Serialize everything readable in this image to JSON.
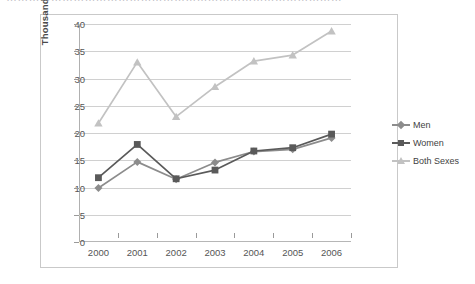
{
  "top_strip": {
    "ghost_text": "………………………………………………………………………………"
  },
  "chart_data": {
    "type": "line",
    "title": "",
    "subtitle": "",
    "xlabel": "",
    "ylabel": "Thousands",
    "categories": [
      "2000",
      "2001",
      "2002",
      "2003",
      "2004",
      "2005",
      "2006"
    ],
    "x": [
      2000,
      2001,
      2002,
      2003,
      2004,
      2005,
      2006
    ],
    "ylim": [
      0,
      40
    ],
    "ytick_values": [
      0,
      5,
      10,
      15,
      20,
      25,
      30,
      35,
      40
    ],
    "ytick_labels": [
      "0",
      "5",
      "10",
      "15",
      "20",
      "25",
      "30",
      "35",
      "40"
    ],
    "grid": "horizontal",
    "legend_position": "right",
    "series": [
      {
        "name": "Men",
        "color": "#8c8c8c",
        "marker": "diamond",
        "values": [
          9.9,
          14.7,
          11.5,
          14.6,
          16.6,
          17.0,
          19.1
        ]
      },
      {
        "name": "Women",
        "color": "#5a5a5a",
        "marker": "square",
        "values": [
          11.8,
          17.9,
          11.6,
          13.2,
          16.7,
          17.3,
          19.8
        ]
      },
      {
        "name": "Both Sexes",
        "color": "#c2c2c2",
        "marker": "triangle",
        "values": [
          21.8,
          33.0,
          23.0,
          28.5,
          33.2,
          34.3,
          38.7
        ]
      }
    ]
  },
  "legend": {
    "items": [
      {
        "label": "Men"
      },
      {
        "label": "Women"
      },
      {
        "label": "Both Sexes"
      }
    ]
  },
  "colors": {
    "frame_border": "#c9c9c9",
    "gridline": "#d0d0d0",
    "axis": "#9a9a9a",
    "tick_text": "#555555",
    "axis_title": "#4a4a4a",
    "plot_background": "#ffffff"
  }
}
